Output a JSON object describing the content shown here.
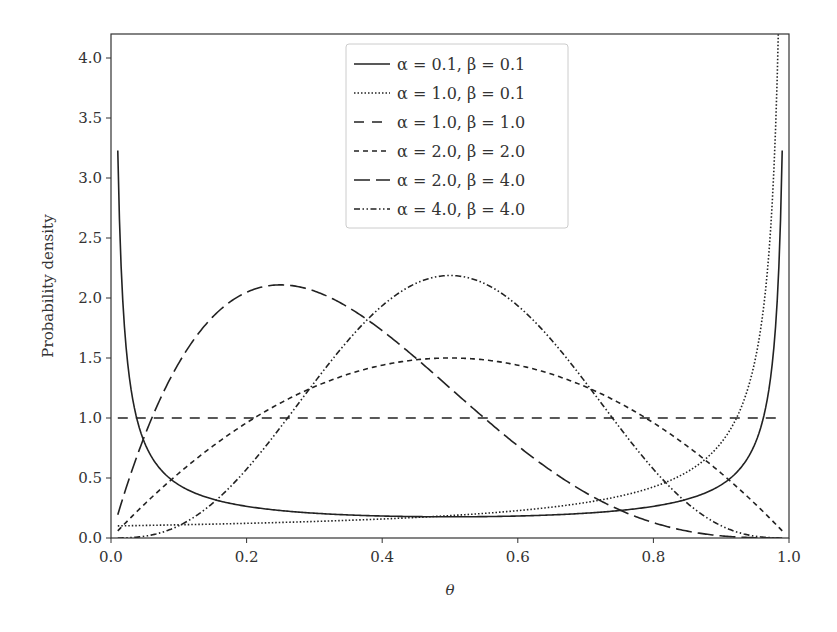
{
  "chart_data": {
    "type": "line",
    "title": "",
    "xlabel": "θ",
    "ylabel": "Probability density",
    "xlim": [
      0.0,
      1.0
    ],
    "ylim": [
      0.0,
      4.2
    ],
    "xticks": [
      "0.0",
      "0.2",
      "0.4",
      "0.6",
      "0.8",
      "1.0"
    ],
    "yticks": [
      "0.0",
      "0.5",
      "1.0",
      "1.5",
      "2.0",
      "2.5",
      "3.0",
      "3.5",
      "4.0"
    ],
    "grid": false,
    "legend_position": "upper center",
    "x_range_plotted": [
      0.01,
      0.99
    ],
    "series": [
      {
        "name": "α = 0.1, β = 0.1",
        "alpha": 0.1,
        "beta": 0.1,
        "style": "solid",
        "x": [
          0.01,
          0.05,
          0.1,
          0.2,
          0.3,
          0.4,
          0.5,
          0.6,
          0.7,
          0.8,
          0.9,
          0.95,
          0.99
        ],
        "values": [
          3.23,
          0.74,
          0.4,
          0.24,
          0.19,
          0.18,
          0.18,
          0.18,
          0.19,
          0.24,
          0.4,
          0.74,
          3.23
        ]
      },
      {
        "name": "α = 1.0, β = 0.1",
        "alpha": 1.0,
        "beta": 0.1,
        "style": "dotted",
        "x": [
          0.01,
          0.1,
          0.2,
          0.3,
          0.4,
          0.5,
          0.6,
          0.7,
          0.8,
          0.9,
          0.95,
          0.99
        ],
        "values": [
          0.1,
          0.11,
          0.12,
          0.14,
          0.16,
          0.19,
          0.23,
          0.3,
          0.43,
          0.79,
          1.49,
          6.31
        ]
      },
      {
        "name": "α = 1.0, β = 1.0",
        "alpha": 1.0,
        "beta": 1.0,
        "style": "dashed",
        "x": [
          0.01,
          0.5,
          0.99
        ],
        "values": [
          1.0,
          1.0,
          1.0
        ]
      },
      {
        "name": "α = 2.0, β = 2.0",
        "alpha": 2.0,
        "beta": 2.0,
        "style": "short-dashed",
        "x": [
          0.01,
          0.1,
          0.2,
          0.3,
          0.4,
          0.5,
          0.6,
          0.7,
          0.8,
          0.9,
          0.99
        ],
        "values": [
          0.06,
          0.54,
          0.96,
          1.26,
          1.44,
          1.5,
          1.44,
          1.26,
          0.96,
          0.54,
          0.06
        ]
      },
      {
        "name": "α = 2.0, β = 4.0",
        "alpha": 2.0,
        "beta": 4.0,
        "style": "long-dashed",
        "x": [
          0.01,
          0.1,
          0.2,
          0.25,
          0.3,
          0.4,
          0.5,
          0.6,
          0.7,
          0.8,
          0.9,
          0.99
        ],
        "values": [
          0.19,
          1.46,
          2.05,
          2.11,
          2.06,
          1.73,
          1.25,
          0.77,
          0.38,
          0.13,
          0.02,
          0.0
        ]
      },
      {
        "name": "α = 4.0, β = 4.0",
        "alpha": 4.0,
        "beta": 4.0,
        "style": "dash-dot-dot",
        "x": [
          0.01,
          0.1,
          0.2,
          0.3,
          0.4,
          0.5,
          0.6,
          0.7,
          0.8,
          0.9,
          0.99
        ],
        "values": [
          0.0,
          0.1,
          0.57,
          1.3,
          1.94,
          2.19,
          1.94,
          1.3,
          0.57,
          0.1,
          0.0
        ]
      }
    ]
  },
  "legend": {
    "items": [
      {
        "label": "α = 0.1, β = 0.1",
        "dash": ""
      },
      {
        "label": "α = 1.0, β = 0.1",
        "dash": "1.5,2"
      },
      {
        "label": "α = 1.0, β = 1.0",
        "dash": "10,8"
      },
      {
        "label": "α = 2.0, β = 2.0",
        "dash": "5,4"
      },
      {
        "label": "α = 2.0, β = 4.0",
        "dash": "16,6"
      },
      {
        "label": "α = 4.0, β = 4.0",
        "dash": "6,2.5,1.5,2.5,1.5,2.5"
      }
    ]
  },
  "colors": {
    "line": "#222222",
    "axis": "#333333",
    "legend_border": "#cccccc",
    "background": "#ffffff"
  }
}
